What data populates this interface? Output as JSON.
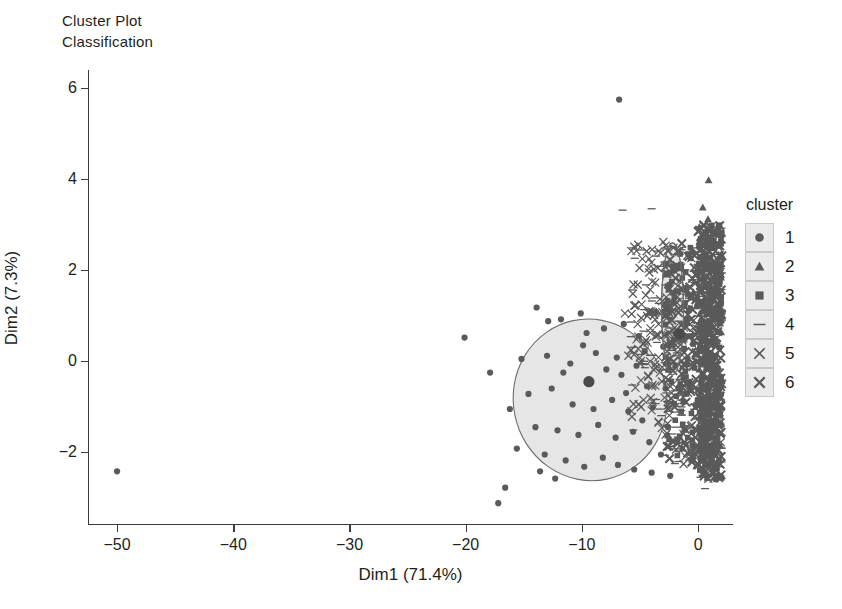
{
  "title": {
    "line1": "Cluster Plot",
    "line2": "Classification"
  },
  "legend": {
    "title": "cluster",
    "items": [
      {
        "label": "1",
        "marker": "circle-marker"
      },
      {
        "label": "2",
        "marker": "triangle-marker"
      },
      {
        "label": "3",
        "marker": "square-marker"
      },
      {
        "label": "4",
        "marker": "dash-marker"
      },
      {
        "label": "5",
        "marker": "cross-marker"
      },
      {
        "label": "6",
        "marker": "cross-bold-marker"
      }
    ]
  },
  "chart_data": {
    "type": "scatter",
    "xlabel": "Dim1 (71.4%)",
    "ylabel": "Dim2 (7.3%)",
    "xlim": [
      -52.5,
      3.0
    ],
    "ylim": [
      -3.6,
      6.4
    ],
    "xticks": [
      -50,
      -40,
      -30,
      -20,
      -10,
      0
    ],
    "xticklabels": [
      "−50",
      "−40",
      "−30",
      "−20",
      "−10",
      "0"
    ],
    "yticks": [
      -2,
      0,
      2,
      4,
      6
    ],
    "yticklabels": [
      "−2",
      "0",
      "2",
      "4",
      "6"
    ],
    "grid": false,
    "legend_position": "right",
    "legend_title": "cluster",
    "colors": {
      "point": "#5a5a5a",
      "point_dark": "#4a4a4a",
      "ellipse_fill": "#e6e6e6",
      "ellipse_stroke": "#6d6d6d",
      "axis": "#3b3b3b",
      "text": "#231f20",
      "legend_swatch": "#ebebeb"
    },
    "ellipses": [
      {
        "cluster": 1,
        "cx": -9.3,
        "cy": -0.85,
        "rx": 6.6,
        "ry": 1.78,
        "angle": -12
      },
      {
        "cluster": 4,
        "cx": -2.2,
        "cy": 1.15,
        "rx": 0.95,
        "ry": 1.45,
        "angle": 0
      }
    ],
    "centroids": [
      {
        "cluster": 1,
        "x": -9.4,
        "y": -0.45
      },
      {
        "cluster": 4,
        "x": -1.6,
        "y": 0.6
      }
    ],
    "series": [
      {
        "name": "1",
        "marker": "circle",
        "points": [
          [
            -50.0,
            -2.42
          ],
          [
            -20.1,
            0.52
          ],
          [
            -17.9,
            -0.25
          ],
          [
            -16.6,
            -2.78
          ],
          [
            -17.2,
            -3.12
          ],
          [
            -6.8,
            5.75
          ],
          [
            -13.9,
            1.18
          ],
          [
            -11.8,
            0.92
          ],
          [
            -9.6,
            0.62
          ],
          [
            -8.1,
            0.72
          ],
          [
            -6.4,
            0.82
          ],
          [
            -5.1,
            0.55
          ],
          [
            -15.2,
            0.05
          ],
          [
            -13.0,
            0.12
          ],
          [
            -11.0,
            -0.05
          ],
          [
            -9.4,
            -0.45
          ],
          [
            -7.9,
            -0.18
          ],
          [
            -6.6,
            -0.3
          ],
          [
            -5.3,
            -0.1
          ],
          [
            -4.4,
            -0.55
          ],
          [
            -14.6,
            -0.72
          ],
          [
            -12.6,
            -0.6
          ],
          [
            -10.8,
            -0.95
          ],
          [
            -9.0,
            -1.05
          ],
          [
            -7.4,
            -0.85
          ],
          [
            -6.0,
            -1.1
          ],
          [
            -4.8,
            -1.3
          ],
          [
            -3.9,
            -1.02
          ],
          [
            -14.0,
            -1.45
          ],
          [
            -12.1,
            -1.52
          ],
          [
            -10.3,
            -1.62
          ],
          [
            -8.6,
            -1.4
          ],
          [
            -7.1,
            -1.68
          ],
          [
            -5.6,
            -1.55
          ],
          [
            -4.2,
            -1.78
          ],
          [
            -13.2,
            -2.05
          ],
          [
            -11.4,
            -2.18
          ],
          [
            -9.8,
            -2.32
          ],
          [
            -8.2,
            -2.12
          ],
          [
            -6.9,
            -2.28
          ],
          [
            -5.5,
            -2.38
          ],
          [
            -4.0,
            -2.45
          ],
          [
            -3.2,
            -2.05
          ],
          [
            -2.6,
            -1.45
          ],
          [
            -2.8,
            -0.6
          ],
          [
            -3.0,
            0.32
          ],
          [
            -3.6,
            1.08
          ],
          [
            -16.2,
            -1.05
          ],
          [
            -15.6,
            -1.92
          ],
          [
            -12.9,
            0.88
          ],
          [
            -10.1,
            1.05
          ],
          [
            -8.8,
            0.18
          ],
          [
            -7.0,
            0.08
          ],
          [
            -6.2,
            -0.7
          ],
          [
            -4.6,
            0.22
          ],
          [
            -11.6,
            -0.25
          ],
          [
            -9.9,
            0.35
          ],
          [
            -13.6,
            -2.42
          ],
          [
            -12.3,
            -2.58
          ],
          [
            -2.4,
            -2.52
          ]
        ]
      },
      {
        "name": "2",
        "marker": "triangle",
        "points": [
          [
            0.9,
            3.98
          ],
          [
            0.4,
            3.38
          ],
          [
            0.85,
            3.12
          ],
          [
            0.1,
            2.95
          ],
          [
            0.55,
            2.78
          ],
          [
            0.95,
            2.62
          ],
          [
            0.3,
            2.45
          ],
          [
            0.7,
            2.28
          ],
          [
            1.05,
            2.12
          ],
          [
            0.2,
            1.95
          ],
          [
            -0.4,
            1.52
          ],
          [
            0.6,
            1.78
          ],
          [
            0.95,
            1.42
          ],
          [
            0.25,
            1.25
          ],
          [
            0.75,
            1.05
          ],
          [
            1.1,
            0.85
          ],
          [
            0.45,
            0.62
          ],
          [
            0.9,
            0.42
          ],
          [
            0.15,
            0.22
          ],
          [
            0.65,
            0.02
          ]
        ]
      },
      {
        "name": "3",
        "marker": "square",
        "points": [
          [
            1.4,
            2.05
          ],
          [
            1.6,
            1.72
          ],
          [
            1.35,
            1.45
          ],
          [
            1.55,
            1.18
          ],
          [
            1.45,
            0.92
          ],
          [
            1.65,
            0.65
          ],
          [
            1.3,
            0.38
          ],
          [
            1.5,
            0.12
          ],
          [
            1.6,
            -0.15
          ],
          [
            1.4,
            -0.42
          ],
          [
            1.55,
            -0.68
          ],
          [
            1.35,
            -0.95
          ],
          [
            1.6,
            -1.22
          ],
          [
            1.45,
            -1.48
          ],
          [
            1.5,
            -1.75
          ],
          [
            1.3,
            -2.02
          ],
          [
            1.55,
            -2.25
          ],
          [
            -1.3,
            0.82
          ],
          [
            -1.0,
            0.55
          ],
          [
            -1.2,
            0.28
          ],
          [
            -0.9,
            0.05
          ],
          [
            -1.1,
            -0.22
          ],
          [
            -0.8,
            -0.48
          ],
          [
            -1.0,
            -0.72
          ]
        ]
      },
      {
        "name": "4",
        "marker": "dash",
        "points": [
          [
            -6.5,
            3.32
          ],
          [
            -4.0,
            3.35
          ],
          [
            -3.5,
            2.42
          ],
          [
            -2.9,
            2.18
          ],
          [
            -2.2,
            1.95
          ],
          [
            -2.6,
            1.62
          ],
          [
            -1.9,
            1.38
          ],
          [
            -2.4,
            1.12
          ],
          [
            -1.7,
            0.88
          ],
          [
            -2.1,
            0.62
          ],
          [
            -2.5,
            0.35
          ],
          [
            -1.8,
            0.12
          ],
          [
            -2.3,
            -0.15
          ],
          [
            -1.6,
            -0.4
          ],
          [
            -2.0,
            -0.65
          ],
          [
            -2.4,
            -0.92
          ],
          [
            -1.5,
            -1.18
          ],
          [
            -1.9,
            -1.45
          ],
          [
            -2.2,
            -1.72
          ],
          [
            -1.7,
            -1.98
          ],
          [
            -2.0,
            -2.25
          ],
          [
            0.2,
            -2.55
          ],
          [
            0.6,
            -2.8
          ]
        ]
      },
      {
        "name": "5",
        "marker": "cross",
        "points": [
          [
            -4.8,
            2.25
          ],
          [
            -4.2,
            1.95
          ],
          [
            -5.2,
            1.68
          ],
          [
            -4.5,
            1.45
          ],
          [
            -3.8,
            2.02
          ],
          [
            -5.5,
            1.22
          ],
          [
            -4.9,
            0.95
          ],
          [
            -4.1,
            0.72
          ],
          [
            -5.3,
            0.48
          ],
          [
            -4.6,
            0.22
          ],
          [
            -5.0,
            -0.05
          ],
          [
            -4.3,
            -0.32
          ],
          [
            -5.4,
            -0.58
          ],
          [
            -4.7,
            -0.85
          ],
          [
            -4.0,
            -1.08
          ],
          [
            -3.4,
            -1.35
          ],
          [
            -3.1,
            1.32
          ],
          [
            -3.6,
            0.58
          ],
          [
            -3.3,
            -0.25
          ],
          [
            -2.8,
            -1.62
          ],
          [
            -6.0,
            0.12
          ],
          [
            -6.3,
            1.05
          ],
          [
            -5.7,
            -1.22
          ],
          [
            -3.0,
            2.62
          ],
          [
            -2.7,
            0.95
          ],
          [
            -2.5,
            -0.95
          ]
        ]
      },
      {
        "name": "6",
        "marker": "cross-bold",
        "points": [
          [
            0.0,
            2.85
          ],
          [
            0.35,
            2.55
          ],
          [
            -0.3,
            2.32
          ],
          [
            0.15,
            2.05
          ],
          [
            -0.5,
            1.82
          ],
          [
            0.25,
            1.58
          ],
          [
            -0.2,
            1.35
          ],
          [
            0.45,
            1.12
          ],
          [
            -0.6,
            0.92
          ],
          [
            0.05,
            0.68
          ],
          [
            -0.35,
            0.45
          ],
          [
            0.3,
            0.22
          ],
          [
            -0.15,
            -0.02
          ],
          [
            0.4,
            -0.28
          ],
          [
            -0.45,
            -0.52
          ],
          [
            0.1,
            -0.78
          ],
          [
            -0.25,
            -1.02
          ],
          [
            0.35,
            -1.28
          ],
          [
            -0.1,
            -1.52
          ],
          [
            0.2,
            -1.78
          ],
          [
            -0.3,
            -2.02
          ],
          [
            0.05,
            -2.28
          ],
          [
            0.5,
            -2.45
          ],
          [
            0.75,
            -1.95
          ],
          [
            0.8,
            -1.05
          ],
          [
            0.85,
            -0.15
          ],
          [
            0.6,
            0.75
          ],
          [
            0.9,
            1.68
          ]
        ]
      }
    ]
  }
}
